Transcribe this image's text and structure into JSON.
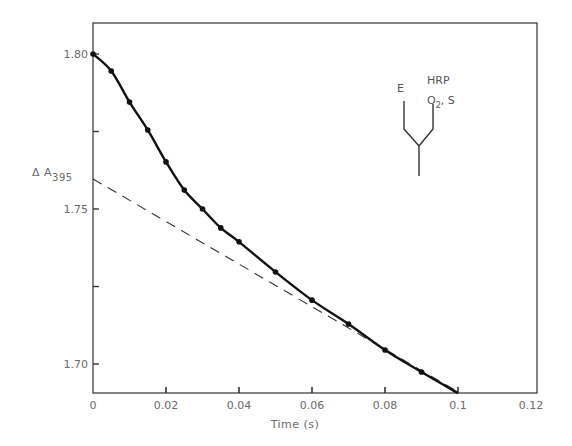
{
  "chart_data": {
    "type": "line",
    "title": "",
    "xlabel": "Time (s)",
    "ylabel": "ΔA395",
    "ylabel_main": "Δ A",
    "ylabel_sub": "395",
    "xlim": [
      0,
      0.12
    ],
    "ylim": [
      1.6906,
      1.815
    ],
    "grid": false,
    "x_ticks": [
      0,
      0.02,
      0.04,
      0.06,
      0.08,
      0.1,
      0.12
    ],
    "x_tick_labels": [
      "0",
      "0.02",
      "0.04",
      "0.06",
      "0.08",
      "0.1",
      "0.12"
    ],
    "y_ticks": [
      1.7,
      1.725,
      1.75,
      1.775,
      1.8
    ],
    "y_tick_labels": [
      "1.70",
      "",
      "1.75",
      "",
      "1.80"
    ],
    "series": [
      {
        "name": "observed",
        "style": "solid with dots",
        "x": [
          0,
          0.005,
          0.01,
          0.015,
          0.02,
          0.025,
          0.03,
          0.035,
          0.04,
          0.05,
          0.06,
          0.07,
          0.08,
          0.09,
          0.1
        ],
        "values": [
          1.8,
          1.7945,
          1.7845,
          1.7755,
          1.7652,
          1.7561,
          1.75,
          1.7439,
          1.7394,
          1.7297,
          1.7206,
          1.7129,
          1.7045,
          1.6974,
          1.6906
        ],
        "markers_at": [
          0,
          0.005,
          0.01,
          0.015,
          0.02,
          0.025,
          0.03,
          0.035,
          0.04,
          0.05,
          0.06,
          0.07,
          0.08,
          0.09
        ]
      },
      {
        "name": "extrapolated",
        "style": "dashed",
        "x": [
          0,
          0.1
        ],
        "values": [
          1.7597,
          1.691
        ]
      }
    ],
    "annotations": [
      {
        "text": "E",
        "type": "inset-label"
      },
      {
        "text": "HRP",
        "type": "inset-label"
      },
      {
        "text": "O2, S",
        "type": "inset-label"
      }
    ],
    "legend": null
  },
  "inset": {
    "label_e": "E",
    "label_hrp": "HRP",
    "label_o": "O",
    "label_o_sub": "2",
    "label_s": ", S"
  },
  "colors": {
    "curve": "#111111",
    "axis": "#333333",
    "text": "#6a6a6a"
  }
}
